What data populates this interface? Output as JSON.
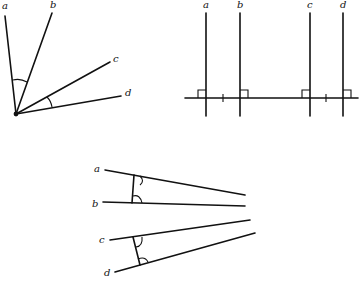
{
  "figures": [
    {
      "id": "intersecting-lines",
      "description": "Four lines a, b, c, d meeting at a single point; angle between a and b and angle between c and d marked with arcs",
      "labels": [
        "a",
        "b",
        "c",
        "d"
      ]
    },
    {
      "id": "parallel-lines",
      "description": "Four vertical lines a, b, c, d each perpendicular to a common horizontal transversal, right-angle marks at each intersection, tick marks showing equal spacing between a-b and c-d",
      "labels": [
        "a",
        "b",
        "c",
        "d"
      ]
    },
    {
      "id": "transversal-pairs",
      "description": "Pair of lines a, b cut by a transversal and pair of lines c, d cut by a transversal, corresponding angles marked with arcs",
      "labels": [
        "a",
        "b",
        "c",
        "d"
      ]
    }
  ],
  "colors": {
    "ink": "#111111",
    "background": "#ffffff"
  }
}
